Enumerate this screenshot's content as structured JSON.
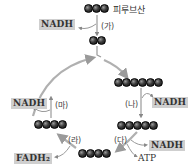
{
  "pyruvate": {
    "carbons": 3,
    "label": "피루브산"
  },
  "acetyl": {
    "carbons": 2
  },
  "steps": {
    "ga": "(가)",
    "na": "(나)",
    "da": "(다)",
    "ra": "(라)",
    "ma": "(마)"
  },
  "products": {
    "ga_nadh": "NADH",
    "na_nadh": "NADH",
    "da_nadh": "NADH",
    "da_atp": "ATP",
    "ra_fadh2": "FADH₂",
    "ma_nadh": "NADH"
  },
  "cycle_compounds": [
    {
      "position": "top-right",
      "carbons": 6
    },
    {
      "position": "right",
      "carbons": 5
    },
    {
      "position": "bottom",
      "carbons": 4
    },
    {
      "position": "left",
      "carbons": 4
    }
  ],
  "colors": {
    "arrow": "#a8a8a8",
    "box": "#cfcfcf",
    "carbon": "#222222"
  }
}
